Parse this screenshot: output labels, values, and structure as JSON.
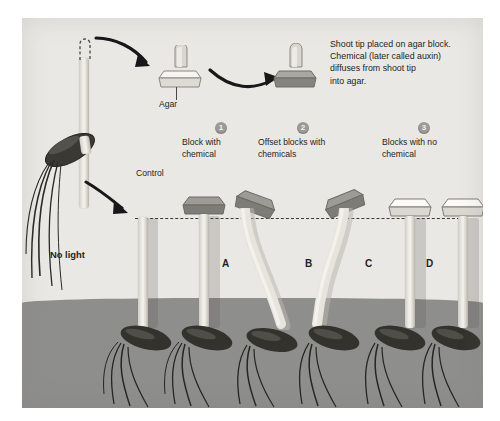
{
  "figure": {
    "type": "scientific-illustration"
  },
  "caption": {
    "text": "Shoot tip placed on agar block.\nChemical (later called auxin)\ndiffuses from shoot tip\ninto agar."
  },
  "labels": {
    "agar": "Agar",
    "control": "Control",
    "no_light": "No light"
  },
  "groups": [
    {
      "number": "1",
      "text": "Block with\nchemical"
    },
    {
      "number": "2",
      "text": "Offset blocks with\nchemicals"
    },
    {
      "number": "3",
      "text": "Blocks with no\nchemical"
    }
  ],
  "specimens": [
    {
      "label": "A",
      "block": "dark",
      "block_position": "centered",
      "bend": "none"
    },
    {
      "label": "B",
      "block": "dark",
      "block_position": "offset-left",
      "bend": "right"
    },
    {
      "label": "C",
      "block": "dark",
      "block_position": "offset-right",
      "bend": "left"
    },
    {
      "label": "D",
      "block": "white",
      "block_position": "centered",
      "bend": "none"
    }
  ],
  "colors": {
    "panel_background": "#e9e8e4",
    "soil": "#8e8e8c",
    "shoot": "#e3e0d9",
    "dark_block": "#8d8b86",
    "white_block": "#f5f4f0",
    "seed": "#2b2a26",
    "text": "#231f20",
    "badge": "#9b9a96",
    "dashline": "#3a3a38"
  }
}
